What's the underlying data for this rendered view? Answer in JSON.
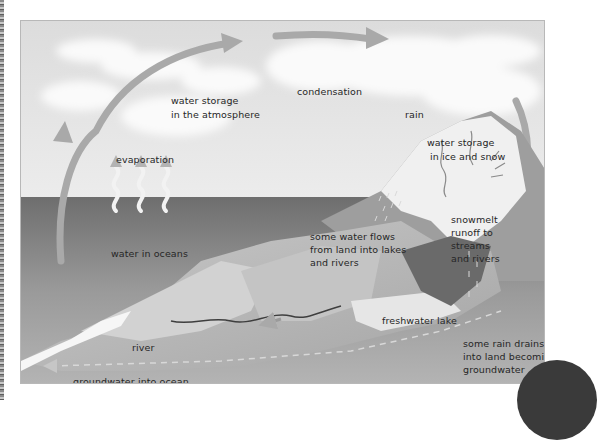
{
  "diagram": {
    "title": "",
    "labels": {
      "condensation": "condensation",
      "atmosphere_line1": "water storage",
      "atmosphere_line2": "in the atmosphere",
      "rain": "rain",
      "ice_line1": "water storage",
      "ice_line2": "in ice and snow",
      "evaporation": "evaporation",
      "oceans": "water in oceans",
      "flows_line1": "some water flows",
      "flows_line2": "from land into lakes",
      "flows_line3": "and rivers",
      "snowmelt_line1": "snowmelt",
      "snowmelt_line2": "runoff to",
      "snowmelt_line3": "streams",
      "snowmelt_line4": "and rivers",
      "lake": "freshwater lake",
      "river": "river",
      "drains_line1": "some rain drains",
      "drains_line2": "into land becoming",
      "drains_line3": "groundwater",
      "groundwater_ocean": "groundwater into ocean"
    },
    "colors": {
      "sky": "#e4e4e4",
      "ocean": "#7d7d7d",
      "land": "#bdbdbd",
      "arrow": "#a9a9a9",
      "text": "#262626"
    }
  }
}
